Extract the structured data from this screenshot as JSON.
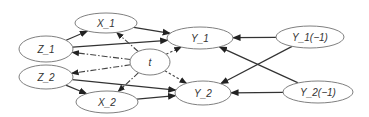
{
  "diagram": {
    "nodes": [
      {
        "id": "Z_1",
        "label": "Z_1",
        "cx": 46,
        "cy": 49,
        "rx": 27,
        "ry": 13
      },
      {
        "id": "Z_2",
        "label": "Z_2",
        "cx": 46,
        "cy": 77,
        "rx": 27,
        "ry": 12
      },
      {
        "id": "X_1",
        "label": "X_1",
        "cx": 106,
        "cy": 23,
        "rx": 31,
        "ry": 10
      },
      {
        "id": "X_2",
        "label": "X_2",
        "cx": 107,
        "cy": 102,
        "rx": 31,
        "ry": 11
      },
      {
        "id": "t",
        "label": "t",
        "cx": 150,
        "cy": 62,
        "rx": 20,
        "ry": 13
      },
      {
        "id": "Y_1",
        "label": "Y_1",
        "cx": 200,
        "cy": 38,
        "rx": 33,
        "ry": 11
      },
      {
        "id": "Y_2",
        "label": "Y_2",
        "cx": 203,
        "cy": 93,
        "rx": 28,
        "ry": 12
      },
      {
        "id": "Y_1_lag",
        "label": "Y_1(−1)",
        "cx": 310,
        "cy": 37,
        "rx": 34,
        "ry": 11
      },
      {
        "id": "Y_2_lag",
        "label": "Y_2(−1)",
        "cx": 318,
        "cy": 92,
        "rx": 35,
        "ry": 11
      }
    ],
    "edges": [
      {
        "from": "Z_1",
        "to": "X_1",
        "style": "solid"
      },
      {
        "from": "Z_1",
        "to": "Y_1",
        "style": "solid"
      },
      {
        "from": "X_1",
        "to": "Y_1",
        "style": "solid"
      },
      {
        "from": "Z_2",
        "to": "X_2",
        "style": "solid"
      },
      {
        "from": "Z_2",
        "to": "Y_2",
        "style": "solid"
      },
      {
        "from": "X_2",
        "to": "Y_2",
        "style": "solid"
      },
      {
        "from": "t",
        "to": "Z_1",
        "style": "dashdot"
      },
      {
        "from": "t",
        "to": "Z_2",
        "style": "dashdot"
      },
      {
        "from": "t",
        "to": "X_1",
        "style": "dashdot"
      },
      {
        "from": "t",
        "to": "X_2",
        "style": "dashdot"
      },
      {
        "from": "t",
        "to": "Y_1",
        "style": "dotted"
      },
      {
        "from": "t",
        "to": "Y_2",
        "style": "dotted"
      },
      {
        "from": "Y_1_lag",
        "to": "Y_1",
        "style": "solid"
      },
      {
        "from": "Y_1_lag",
        "to": "Y_2",
        "style": "solid"
      },
      {
        "from": "Y_2_lag",
        "to": "Y_1",
        "style": "solid"
      },
      {
        "from": "Y_2_lag",
        "to": "Y_2",
        "style": "solid"
      }
    ]
  }
}
